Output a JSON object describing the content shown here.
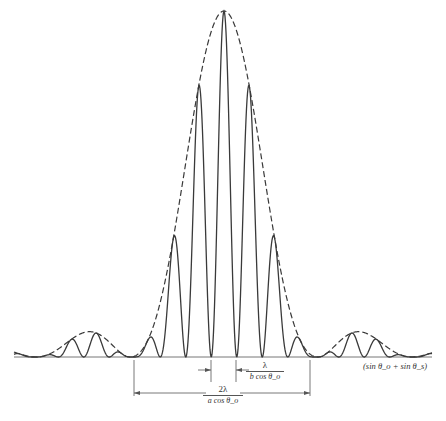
{
  "chart_data": {
    "type": "line",
    "title": "",
    "xlabel": "(sin θ_o + sin θ_s)",
    "ylabel": "",
    "grid": false,
    "legend": null,
    "series": [
      {
        "name": "intensity",
        "style": "solid",
        "model": "sinc^2(envelope) * cos^2(fringes)"
      },
      {
        "name": "envelope",
        "style": "dashed",
        "model": "sinc^2"
      }
    ],
    "layout": {
      "baseline_y": 357,
      "center_x": 224,
      "peak_y": 11,
      "x_start": 14,
      "x_end": 432,
      "fringe_spacing_px": 25.5,
      "envelope_first_zero_offset_px": 94
    },
    "annotations": [
      {
        "id": "fringe_spacing",
        "numerator": "λ",
        "denominator": "b cos θ_o",
        "meaning": "fringe spacing"
      },
      {
        "id": "envelope_width",
        "numerator": "2λ",
        "denominator": "a cos θ_o",
        "meaning": "central diffraction lobe width"
      }
    ]
  },
  "labels": {
    "x_axis": "(sin θ_o + sin θ_s)",
    "fringe_num": "λ",
    "fringe_den": "b cos θ_o",
    "env_num": "2λ",
    "env_den": "a cos θ_o"
  },
  "colors": {
    "curve": "#3a3a3a",
    "axis": "#555555"
  }
}
